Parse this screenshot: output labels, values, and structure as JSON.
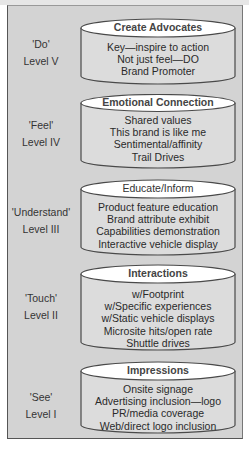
{
  "diagram": {
    "levels": [
      {
        "verb": "'Do'",
        "level": "Level V",
        "title": "Create Advocates",
        "items": [
          "Key—inspire to action",
          "Not just feel—DO",
          "Brand Promoter"
        ]
      },
      {
        "verb": "'Feel'",
        "level": "Level IV",
        "title": "Emotional Connection",
        "items": [
          "Shared values",
          "This brand is like me",
          "Sentimental/affinity",
          "Trail Drives"
        ]
      },
      {
        "verb": "'Understand'",
        "level": "Level III",
        "title": "Educate/Inform",
        "items": [
          "Product feature education",
          "Brand attribute exhibit",
          "Capabilities demonstration",
          "Interactive vehicle display"
        ]
      },
      {
        "verb": "'Touch'",
        "level": "Level II",
        "title": "Interactions",
        "items": [
          "w/Footprint",
          "w/Specific experiences",
          "w/Static vehicle displays",
          "Microsite hits/open rate",
          "Shuttle drives"
        ]
      },
      {
        "verb": "'See'",
        "level": "Level I",
        "title": "Impressions",
        "items": [
          "Onsite signage",
          "Advertising inclusion—logo",
          "PR/media coverage",
          "Web/direct logo inclusion"
        ]
      }
    ]
  },
  "colors": {
    "panel_bg": "#d3d3d3",
    "cylinder_top": "#ffffff",
    "cylinder_body": "#dcdcdc",
    "stroke": "#4a4a4a"
  }
}
